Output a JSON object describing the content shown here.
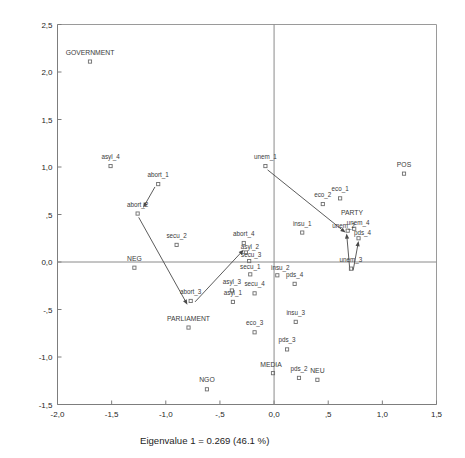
{
  "figure": {
    "type": "correspondence-analysis-scatter",
    "background": "#ffffff"
  },
  "axes": {
    "x_title": "Eigenvalue 1 = 0.269 (46.1 %)",
    "y_title": "Eigenvalue 2 = 0.144 (24.6 %)",
    "x_ticks": [
      "-2,0",
      "-1,5",
      "-1,0",
      "-,5",
      "0,0",
      ",5",
      "1,0",
      "1,5"
    ],
    "y_ticks": [
      "2,5",
      "2,0",
      "1,5",
      "1,0",
      ",5",
      "0,0",
      "-,5",
      "-1,0",
      "-1,5"
    ]
  },
  "chart_data": {
    "type": "scatter",
    "title": "",
    "xlabel": "Eigenvalue 1 = 0.269 (46.1 %)",
    "ylabel": "Eigenvalue 2 = 0.144 (24.6 %)",
    "xlim": [
      -2.0,
      1.5
    ],
    "ylim": [
      -1.5,
      2.5
    ],
    "xticks": [
      -2.0,
      -1.5,
      -1.0,
      -0.5,
      0.0,
      0.5,
      1.0,
      1.5
    ],
    "yticks": [
      -1.5,
      -1.0,
      -0.5,
      0.0,
      0.5,
      1.0,
      1.5,
      2.0,
      2.5
    ],
    "xtick_labels": [
      "-2,0",
      "-1,5",
      "-1,0",
      "-,5",
      "0,0",
      ",5",
      "1,0",
      "1,5"
    ],
    "ytick_labels": [
      "-1,5",
      "-1,0",
      "-,5",
      "0,0",
      ",5",
      "1,0",
      "1,5",
      "2,0",
      "2,5"
    ],
    "grid": false,
    "legend": "none",
    "decimal_separator": "comma",
    "marker_style": "open-square",
    "points": [
      {
        "label": "GOVERNMENT",
        "x": -1.7,
        "y": 2.11,
        "label_dx": 0,
        "label_dy": -7,
        "emphasis": "group"
      },
      {
        "label": "asyl_4",
        "x": -1.51,
        "y": 1.01,
        "label_dx": 0,
        "label_dy": -7,
        "emphasis": "item"
      },
      {
        "label": "abort_1",
        "x": -1.07,
        "y": 0.82,
        "label_dx": 0,
        "label_dy": -7,
        "emphasis": "item"
      },
      {
        "label": "abort_2",
        "x": -1.26,
        "y": 0.51,
        "label_dx": 0,
        "label_dy": -7,
        "emphasis": "item"
      },
      {
        "label": "secu_2",
        "x": -0.9,
        "y": 0.18,
        "label_dx": 0,
        "label_dy": -7,
        "emphasis": "item"
      },
      {
        "label": "NEG",
        "x": -1.29,
        "y": -0.06,
        "label_dx": 0,
        "label_dy": -7,
        "emphasis": "group"
      },
      {
        "label": "abort_3",
        "x": -0.77,
        "y": -0.41,
        "label_dx": 0,
        "label_dy": -7,
        "emphasis": "item"
      },
      {
        "label": "PARLIAMENT",
        "x": -0.79,
        "y": -0.69,
        "label_dx": 0,
        "label_dy": -7,
        "emphasis": "group"
      },
      {
        "label": "NGO",
        "x": -0.62,
        "y": -1.34,
        "label_dx": 0,
        "label_dy": -7,
        "emphasis": "group"
      },
      {
        "label": "abort_4",
        "x": -0.28,
        "y": 0.2,
        "label_dx": 0,
        "label_dy": -7,
        "emphasis": "item"
      },
      {
        "label": "asyl_2",
        "x": -0.26,
        "y": 0.1,
        "label_dx": 4,
        "label_dy": -4,
        "emphasis": "item"
      },
      {
        "label": "secu_3",
        "x": -0.23,
        "y": 0.01,
        "label_dx": 2,
        "label_dy": -4,
        "emphasis": "item"
      },
      {
        "label": "secu_1",
        "x": -0.22,
        "y": -0.13,
        "label_dx": 0,
        "label_dy": -5,
        "emphasis": "item"
      },
      {
        "label": "asyl_3",
        "x": -0.39,
        "y": -0.3,
        "label_dx": 0,
        "label_dy": -7,
        "emphasis": "item"
      },
      {
        "label": "asyl_1",
        "x": -0.38,
        "y": -0.42,
        "label_dx": 0,
        "label_dy": -7,
        "emphasis": "item"
      },
      {
        "label": "secu_4",
        "x": -0.18,
        "y": -0.33,
        "label_dx": 0,
        "label_dy": -7,
        "emphasis": "item"
      },
      {
        "label": "eco_3",
        "x": -0.18,
        "y": -0.74,
        "label_dx": 0,
        "label_dy": -7,
        "emphasis": "item"
      },
      {
        "label": "MEDIA",
        "x": -0.01,
        "y": -1.17,
        "label_dx": -2,
        "label_dy": -6,
        "emphasis": "group"
      },
      {
        "label": "unem_1",
        "x": -0.08,
        "y": 1.01,
        "label_dx": 0,
        "label_dy": -7,
        "emphasis": "item"
      },
      {
        "label": "insu_2",
        "x": 0.03,
        "y": -0.14,
        "label_dx": 3,
        "label_dy": -5,
        "emphasis": "item"
      },
      {
        "label": "pds_4",
        "x": 0.19,
        "y": -0.23,
        "label_dx": 0,
        "label_dy": -7,
        "emphasis": "item"
      },
      {
        "label": "insu_3",
        "x": 0.2,
        "y": -0.63,
        "label_dx": 0,
        "label_dy": -7,
        "emphasis": "item"
      },
      {
        "label": "pds_3",
        "x": 0.12,
        "y": -0.92,
        "label_dx": 0,
        "label_dy": -7,
        "emphasis": "item"
      },
      {
        "label": "pds_2",
        "x": 0.23,
        "y": -1.22,
        "label_dx": 0,
        "label_dy": -7,
        "emphasis": "item"
      },
      {
        "label": "NEU",
        "x": 0.4,
        "y": -1.24,
        "label_dx": 0,
        "label_dy": -7,
        "emphasis": "group"
      },
      {
        "label": "insu_1",
        "x": 0.26,
        "y": 0.31,
        "label_dx": 0,
        "label_dy": -7,
        "emphasis": "item"
      },
      {
        "label": "eco_2",
        "x": 0.45,
        "y": 0.61,
        "label_dx": 0,
        "label_dy": -7,
        "emphasis": "item"
      },
      {
        "label": "eco_1",
        "x": 0.61,
        "y": 0.67,
        "label_dx": 0,
        "label_dy": -7,
        "emphasis": "item"
      },
      {
        "label": "PARTY",
        "x": 0.72,
        "y": 0.5,
        "label_dx": 0,
        "label_dy": 0,
        "emphasis": "group",
        "no_marker": true
      },
      {
        "label": "unem_4",
        "x": 0.74,
        "y": 0.35,
        "label_dx": 4,
        "label_dy": -4,
        "emphasis": "item"
      },
      {
        "label": "unem_2",
        "x": 0.68,
        "y": 0.33,
        "label_dx": -4,
        "label_dy": -3,
        "emphasis": "item"
      },
      {
        "label": "pds_4b",
        "x": 0.78,
        "y": 0.25,
        "label_dx": 4,
        "label_dy": -3,
        "emphasis": "item",
        "display": "pds_4"
      },
      {
        "label": "unem_3",
        "x": 0.71,
        "y": -0.07,
        "label_dx": 0,
        "label_dy": -7,
        "emphasis": "item"
      },
      {
        "label": "POS",
        "x": 1.2,
        "y": 0.93,
        "label_dx": 0,
        "label_dy": -7,
        "emphasis": "group"
      }
    ],
    "arrows": [
      {
        "from_label": "abort_1",
        "to_label": "abort_2",
        "x1": -1.1,
        "y1": 0.79,
        "x2": -1.21,
        "y2": 0.57
      },
      {
        "from_label": "abort_2",
        "to_label": "abort_3",
        "x1": -1.25,
        "y1": 0.47,
        "x2": -0.8,
        "y2": -0.45
      },
      {
        "from_label": "abort_3",
        "to_label": "abort_4",
        "x1": -0.73,
        "y1": -0.42,
        "x2": -0.28,
        "y2": 0.13
      },
      {
        "from_label": "unem_1",
        "to_label": "unem_2",
        "x1": -0.06,
        "y1": 0.97,
        "x2": 0.66,
        "y2": 0.31
      },
      {
        "from_label": "unem_3",
        "to_label": "unem_2",
        "x1": 0.7,
        "y1": -0.09,
        "x2": 0.67,
        "y2": 0.3
      },
      {
        "from_label": "unem_3",
        "to_label": "pds_4b",
        "x1": 0.73,
        "y1": -0.09,
        "x2": 0.78,
        "y2": 0.22
      }
    ]
  }
}
